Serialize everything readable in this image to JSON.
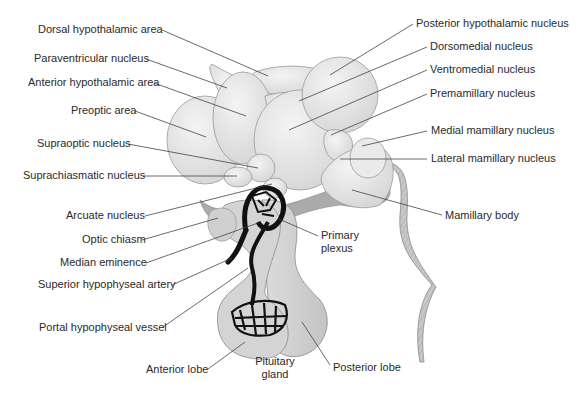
{
  "diagram": {
    "colors": {
      "background": "#ffffff",
      "nuclei_fill": "#e4e4e4",
      "nuclei_highlight": "#f2f2f2",
      "shadow_fill": "#a8a8a8",
      "pituitary_fill": "#cfcfcf",
      "vessel": "#111111",
      "text": "#2a2a2a",
      "leader_line": "#444444"
    },
    "labels_left": [
      {
        "id": "dorsal-hypothalamic-area",
        "text": "Dorsal hypothalamic area"
      },
      {
        "id": "paraventricular-nucleus",
        "text": "Paraventricular nucleus"
      },
      {
        "id": "anterior-hypothalamic-area",
        "text": "Anterior hypothalamic area"
      },
      {
        "id": "preoptic-area",
        "text": "Preoptic area"
      },
      {
        "id": "supraoptic-nucleus",
        "text": "Supraoptic nucleus"
      },
      {
        "id": "suprachiasmatic-nucleus",
        "text": "Suprachiasmatic nucleus"
      },
      {
        "id": "arcuate-nucleus",
        "text": "Arcuate nucleus"
      },
      {
        "id": "optic-chiasm",
        "text": "Optic chiasm"
      },
      {
        "id": "median-eminence",
        "text": "Median eminence"
      },
      {
        "id": "superior-hypophyseal-artery",
        "text": "Superior hypophyseal artery"
      },
      {
        "id": "portal-hypophyseal-vessel",
        "text": "Portal hypophyseal vessel"
      },
      {
        "id": "anterior-lobe",
        "text": "Anterior lobe"
      }
    ],
    "labels_right": [
      {
        "id": "posterior-hypothalamic-nucleus",
        "text": "Posterior hypothalamic nucleus"
      },
      {
        "id": "dorsomedial-nucleus",
        "text": "Dorsomedial nucleus"
      },
      {
        "id": "ventromedial-nucleus",
        "text": "Ventromedial nucleus"
      },
      {
        "id": "premamillary-nucleus",
        "text": "Premamillary nucleus"
      },
      {
        "id": "medial-mamillary-nucleus",
        "text": "Medial mamillary nucleus"
      },
      {
        "id": "lateral-mamillary-nucleus",
        "text": "Lateral mamillary nucleus"
      },
      {
        "id": "mamillary-body",
        "text": "Mamillary body"
      },
      {
        "id": "primary-plexus",
        "text": "Primary plexus",
        "line1": "Primary",
        "line2": "plexus"
      },
      {
        "id": "posterior-lobe",
        "text": "Posterior lobe"
      }
    ],
    "label_bottom": {
      "id": "pituitary-gland",
      "text": "Pituitary gland",
      "line1": "Pituitary",
      "line2": "gland"
    }
  }
}
